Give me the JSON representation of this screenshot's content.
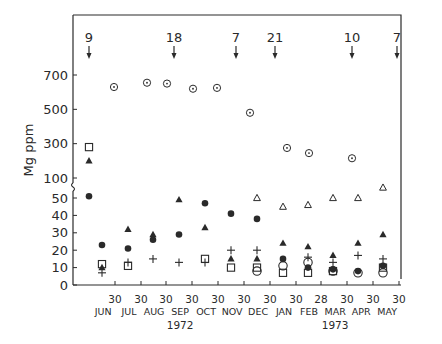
{
  "chart_data": {
    "type": "scatter",
    "title": "",
    "ylabel": "Mg  ppm",
    "xlabel": "",
    "y_axis": {
      "broken": true,
      "lower_ticks": [
        0,
        10,
        20,
        30,
        40,
        50
      ],
      "upper_ticks": [
        100,
        300,
        500,
        700
      ],
      "lower_range": [
        0,
        55
      ],
      "upper_range": [
        100,
        800
      ]
    },
    "x_axis": {
      "tick_labels": [
        "30",
        "30",
        "30",
        "30",
        "30",
        "30",
        "30",
        "30",
        "28",
        "30",
        "30",
        "30"
      ],
      "months": [
        "JUN",
        "JUL",
        "AUG",
        "SEP",
        "OCT",
        "NOV",
        "DEC",
        "JAN",
        "FEB",
        "MAR",
        "APR",
        "MAY"
      ],
      "years": [
        {
          "label": "1972",
          "under_month_index": 3
        },
        {
          "label": "1973",
          "under_month_index": 9
        }
      ]
    },
    "annotations": [
      {
        "label": "9",
        "x": 89
      },
      {
        "label": "18",
        "x": 174
      },
      {
        "label": "7",
        "x": 236
      },
      {
        "label": "21",
        "x": 275
      },
      {
        "label": "10",
        "x": 352
      },
      {
        "label": "7",
        "x": 397
      }
    ],
    "grid": false,
    "legend": null,
    "series": [
      {
        "name": "dotted-circle",
        "marker": "circle-dot",
        "points": [
          {
            "x": 114,
            "y": 630
          },
          {
            "x": 147,
            "y": 655
          },
          {
            "x": 167,
            "y": 650
          },
          {
            "x": 193,
            "y": 620
          },
          {
            "x": 217,
            "y": 625
          },
          {
            "x": 250,
            "y": 480
          },
          {
            "x": 287,
            "y": 275
          },
          {
            "x": 309,
            "y": 245
          },
          {
            "x": 352,
            "y": 215
          }
        ]
      },
      {
        "name": "open-triangle",
        "marker": "triangle-open",
        "points": [
          {
            "x": 257,
            "y": 50
          },
          {
            "x": 283,
            "y": 45
          },
          {
            "x": 308,
            "y": 46
          },
          {
            "x": 333,
            "y": 50
          },
          {
            "x": 358,
            "y": 50
          },
          {
            "x": 383,
            "y": 56
          }
        ]
      },
      {
        "name": "filled-triangle",
        "marker": "triangle-filled",
        "points": [
          {
            "x": 89,
            "y": 200
          },
          {
            "x": 102,
            "y": 10
          },
          {
            "x": 128,
            "y": 32
          },
          {
            "x": 153,
            "y": 29
          },
          {
            "x": 179,
            "y": 49
          },
          {
            "x": 205,
            "y": 33
          },
          {
            "x": 231,
            "y": 15
          },
          {
            "x": 257,
            "y": 15
          },
          {
            "x": 283,
            "y": 24
          },
          {
            "x": 308,
            "y": 22
          },
          {
            "x": 333,
            "y": 17
          },
          {
            "x": 358,
            "y": 24
          },
          {
            "x": 383,
            "y": 29
          }
        ]
      },
      {
        "name": "filled-circle",
        "marker": "circle-filled",
        "points": [
          {
            "x": 89,
            "y": 51
          },
          {
            "x": 102,
            "y": 23
          },
          {
            "x": 128,
            "y": 21
          },
          {
            "x": 153,
            "y": 26
          },
          {
            "x": 179,
            "y": 29
          },
          {
            "x": 205,
            "y": 47
          },
          {
            "x": 231,
            "y": 41
          },
          {
            "x": 257,
            "y": 38
          },
          {
            "x": 283,
            "y": 15
          },
          {
            "x": 308,
            "y": 10
          },
          {
            "x": 333,
            "y": 9
          },
          {
            "x": 358,
            "y": 8
          },
          {
            "x": 383,
            "y": 11
          }
        ]
      },
      {
        "name": "open-square",
        "marker": "square-open",
        "points": [
          {
            "x": 89,
            "y": 280
          },
          {
            "x": 102,
            "y": 12
          },
          {
            "x": 128,
            "y": 11
          },
          {
            "x": 205,
            "y": 15
          },
          {
            "x": 231,
            "y": 10
          },
          {
            "x": 257,
            "y": 10
          },
          {
            "x": 283,
            "y": 7
          },
          {
            "x": 308,
            "y": 7
          },
          {
            "x": 333,
            "y": 8
          },
          {
            "x": 383,
            "y": 10
          }
        ]
      },
      {
        "name": "open-circle",
        "marker": "circle-open",
        "points": [
          {
            "x": 257,
            "y": 8
          },
          {
            "x": 283,
            "y": 11
          },
          {
            "x": 308,
            "y": 13
          },
          {
            "x": 333,
            "y": 8
          },
          {
            "x": 358,
            "y": 7
          },
          {
            "x": 383,
            "y": 7
          }
        ]
      },
      {
        "name": "plus",
        "marker": "plus",
        "points": [
          {
            "x": 102,
            "y": 7
          },
          {
            "x": 128,
            "y": 13
          },
          {
            "x": 153,
            "y": 15
          },
          {
            "x": 179,
            "y": 13
          },
          {
            "x": 205,
            "y": 13
          },
          {
            "x": 231,
            "y": 20
          },
          {
            "x": 257,
            "y": 20
          },
          {
            "x": 308,
            "y": 16
          },
          {
            "x": 333,
            "y": 13
          },
          {
            "x": 358,
            "y": 17
          },
          {
            "x": 383,
            "y": 15
          }
        ]
      }
    ]
  }
}
